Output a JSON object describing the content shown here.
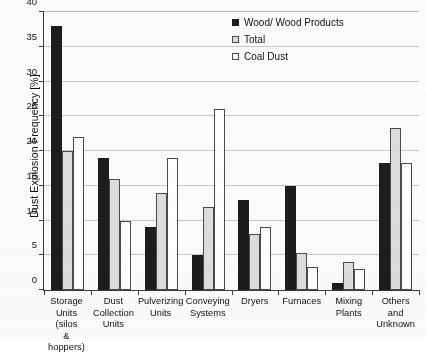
{
  "chart_data": {
    "type": "bar",
    "title": "",
    "subtitle": "",
    "xlabel": "",
    "ylabel": "Dust Explosion Frequency [%]",
    "ylim": [
      0,
      40
    ],
    "ytick_step": 5,
    "yticks": [
      0,
      5,
      10,
      15,
      20,
      25,
      30,
      35,
      40
    ],
    "ytick_labels": [
      "0",
      "5",
      "10",
      "15",
      "20",
      "25",
      "30",
      "35",
      "40"
    ],
    "grid": true,
    "grid_axis": "y",
    "legend_position": "top-right",
    "categories": [
      "Storage Units (silos & hoppers)",
      "Dust Collection Units",
      "Pulverizing Units",
      "Conveying Systems",
      "Dryers",
      "Furnaces",
      "Mixing Plants",
      "Others and Unknown"
    ],
    "category_lines": [
      [
        "Storage",
        "Units (silos",
        "& hoppers)"
      ],
      [
        "Dust",
        "Collection",
        "Units"
      ],
      [
        "Pulverizing",
        "Units"
      ],
      [
        "Conveying",
        "Systems"
      ],
      [
        "Dryers"
      ],
      [
        "Furnaces"
      ],
      [
        "Mixing",
        "Plants"
      ],
      [
        "Others and",
        "Unknown"
      ]
    ],
    "series": [
      {
        "name": "Wood/ Wood Products",
        "key": "wood",
        "color": "#1d1d1d",
        "fill": "solid-black",
        "values": [
          38,
          19,
          9,
          5,
          13,
          15,
          1,
          18.3
        ]
      },
      {
        "name": "Total",
        "key": "total",
        "color": "#dedede",
        "fill": "light-gray",
        "values": [
          20,
          16,
          14,
          12,
          8,
          5.3,
          4,
          23.3
        ]
      },
      {
        "name": "Coal Dust",
        "key": "coal",
        "color": "#ffffff",
        "fill": "white-outline",
        "values": [
          22,
          10,
          19,
          26,
          9,
          3.3,
          3,
          18.3
        ]
      }
    ]
  },
  "legend": {
    "entries": [
      {
        "label": "Wood/ Wood Products",
        "swatch": "s-wood"
      },
      {
        "label": "Total",
        "swatch": "s-total"
      },
      {
        "label": "Coal Dust",
        "swatch": "s-coal"
      }
    ]
  },
  "axis": {
    "y_title": "Dust Explosion Frequency [%]"
  }
}
